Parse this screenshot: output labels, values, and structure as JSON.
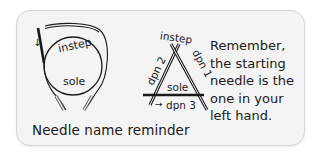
{
  "diagram": {
    "circular": {
      "top_label": "instep",
      "bottom_label": "sole",
      "arrow": "↓"
    },
    "triangle": {
      "top_label": "instep",
      "left_label": "dpn 2",
      "right_label": "dpn 1",
      "inner_label": "sole",
      "bottom_label": "dpn 3",
      "arrow": "→"
    },
    "caption": "Needle name reminder",
    "reminder_lines": [
      "Remember,",
      "the starting",
      "needle is the",
      "one in your",
      "left hand."
    ]
  },
  "colors": {
    "card_bg": "#f4f4f4",
    "card_border": "#d6d6d6",
    "ink": "#1a1a1a"
  }
}
